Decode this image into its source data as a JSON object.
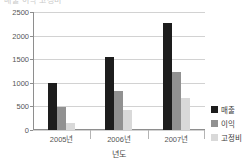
{
  "top_clip": {
    "text": "매출 이익 고정비"
  },
  "chart_data": {
    "type": "bar",
    "title": "",
    "subtitle": "",
    "xlabel": "년도",
    "ylabel": "",
    "categories": [
      "2005년",
      "2006년",
      "2007년"
    ],
    "series": [
      {
        "name": "매출",
        "color": "#1d1d1d",
        "values": [
          1000,
          1540,
          2270
        ]
      },
      {
        "name": "이익",
        "color": "#919191",
        "values": [
          490,
          830,
          1230
        ]
      },
      {
        "name": "고정비",
        "color": "#d9d9d9",
        "values": [
          150,
          420,
          670
        ]
      }
    ],
    "ylim": [
      0,
      2500
    ],
    "yticks": [
      0,
      500,
      1000,
      1500,
      2000,
      2500
    ],
    "ytick_labels": [
      "0",
      "500",
      "1000",
      "1500",
      "2000",
      "2500"
    ],
    "grid": true,
    "grid_axis": "y",
    "legend_position": "right",
    "annotations": []
  }
}
